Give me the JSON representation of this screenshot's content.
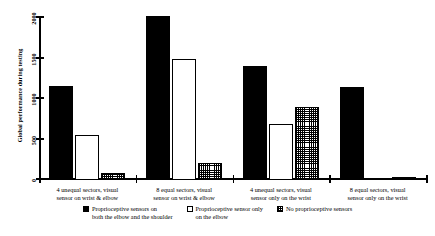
{
  "chart_data": {
    "type": "bar",
    "title": "",
    "xlabel": "",
    "ylabel": "Global performance during testing",
    "ylim": [
      0,
      2000
    ],
    "yticks": [
      0,
      500,
      1000,
      1500,
      2000
    ],
    "ytick_labels": [
      "0",
      "500",
      "1000",
      "1500",
      "2000"
    ],
    "grid": false,
    "legend_position": "bottom",
    "categories": [
      "4 unequal sectors, visual\nsensor on wrist & elbow",
      "8 equal sectors, visual\nsensor on wrist & elbow",
      "4 unequal sectors, visual\nsensor only on the wrist",
      "8 equal sectors, visual\nsensor only on the wrist"
    ],
    "series": [
      {
        "name": "Proprioceptive sensors on\nboth the elbow and the shoulder",
        "fill": "black",
        "color": "#000000",
        "values": [
          1165,
          2025,
          1405,
          1150
        ]
      },
      {
        "name": "Proprioceptive sensor only\non the elbow",
        "fill": "white",
        "color": "#ffffff",
        "values": [
          560,
          1500,
          695,
          0
        ]
      },
      {
        "name": "No proprioceptive sensors",
        "fill": "hatch",
        "color": "#000000",
        "values": [
          90,
          210,
          900,
          40
        ]
      }
    ]
  }
}
